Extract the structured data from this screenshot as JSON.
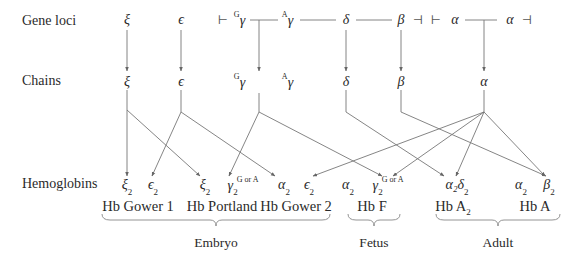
{
  "rows": {
    "gene_loci_label": "Gene loci",
    "chains_label": "Chains",
    "hemoglobins_label": "Hemoglobins"
  },
  "gene_loci": [
    {
      "id": "xi",
      "symbol": "ξ",
      "x": 127
    },
    {
      "id": "epsilon",
      "symbol": "ϵ",
      "x": 181
    },
    {
      "id": "G-gamma",
      "symbol": "γ",
      "prefix": "G",
      "x": 240
    },
    {
      "id": "A-gamma",
      "symbol": "γ",
      "prefix": "A",
      "x": 288
    },
    {
      "id": "delta",
      "symbol": "δ",
      "x": 346
    },
    {
      "id": "beta",
      "symbol": "β",
      "x": 401
    },
    {
      "id": "alpha-1",
      "symbol": "α",
      "x": 455
    },
    {
      "id": "alpha-2",
      "symbol": "α",
      "x": 510
    }
  ],
  "cluster_markers": {
    "beta_cluster_start": "⊢",
    "beta_cluster_end": "⊣",
    "alpha_cluster_start": "⊢",
    "alpha_cluster_end": "⊣"
  },
  "chains": [
    {
      "id": "xi",
      "symbol": "ξ",
      "x": 127
    },
    {
      "id": "epsilon",
      "symbol": "ϵ",
      "x": 181
    },
    {
      "id": "G-gamma",
      "symbol": "γ",
      "prefix": "G",
      "x": 240
    },
    {
      "id": "A-gamma",
      "symbol": "γ",
      "prefix": "A",
      "x": 288
    },
    {
      "id": "delta",
      "symbol": "δ",
      "x": 346
    },
    {
      "id": "beta",
      "symbol": "β",
      "x": 401
    },
    {
      "id": "alpha",
      "symbol": "α",
      "x": 484
    }
  ],
  "hemoglobin_subunits": [
    {
      "symbol": "ξ",
      "sub": "2",
      "sup": "",
      "x": 127
    },
    {
      "symbol": "ϵ",
      "sub": "2",
      "sup": "",
      "x": 153
    },
    {
      "symbol": "ξ",
      "sub": "2",
      "sup": "",
      "x": 205
    },
    {
      "symbol": "γ",
      "sub": "2",
      "sup": "G or A",
      "x": 242
    },
    {
      "symbol": "α",
      "sub": "2",
      "sup": "",
      "x": 284
    },
    {
      "symbol": "ϵ",
      "sub": "2",
      "sup": "",
      "x": 309
    },
    {
      "symbol": "α",
      "sub": "2",
      "sup": "",
      "x": 348
    },
    {
      "symbol": "γ",
      "sub": "2",
      "sup": "G or A",
      "x": 387
    },
    {
      "symbol": "α₂δ",
      "sub": "2",
      "sup": "",
      "x": 457
    },
    {
      "symbol": "α",
      "sub": "2",
      "sup": "",
      "x": 521
    },
    {
      "symbol": "β",
      "sub": "2",
      "sup": "",
      "x": 548
    }
  ],
  "hemoglobins": [
    {
      "name": "Hb Gower 1",
      "x": 138
    },
    {
      "name": "Hb Portland",
      "x": 222
    },
    {
      "name": "Hb Gower 2",
      "x": 296
    },
    {
      "name": "Hb F",
      "x": 372
    },
    {
      "name": "Hb A",
      "sub": "2",
      "x": 452
    },
    {
      "name": "Hb A",
      "x": 535
    }
  ],
  "stages": [
    {
      "name": "Embryo",
      "x": 216
    },
    {
      "name": "Fetus",
      "x": 374
    },
    {
      "name": "Adult",
      "x": 498
    }
  ],
  "edges": [
    {
      "from": "ξ chain",
      "to": "ξ₂ (Hb Gower 1)"
    },
    {
      "from": "ξ chain",
      "to": "ξ₂ (Hb Portland)"
    },
    {
      "from": "ϵ chain",
      "to": "ϵ₂ (Hb Gower 1)"
    },
    {
      "from": "ϵ chain",
      "to": "Hb Gower 2"
    },
    {
      "from": "γ chains",
      "to": "γ₂ (Hb Portland)"
    },
    {
      "from": "γ chains",
      "to": "γ₂ (Hb F)"
    },
    {
      "from": "δ chain",
      "to": "α₂δ₂ (Hb A₂)"
    },
    {
      "from": "β chain",
      "to": "β₂ (Hb A)"
    },
    {
      "from": "α chain",
      "to": "Hb Gower 2"
    },
    {
      "from": "α chain",
      "to": "γ₂ (Hb F)"
    },
    {
      "from": "α chain",
      "to": "α₂δ₂ (Hb A₂)"
    },
    {
      "from": "α chain",
      "to": "β₂ (Hb A)"
    }
  ]
}
